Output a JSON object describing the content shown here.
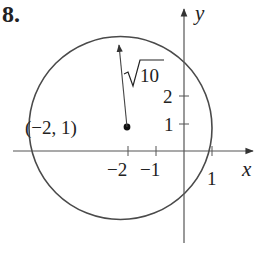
{
  "problem": {
    "number": "8."
  },
  "axes": {
    "x_label": "x",
    "y_label": "y",
    "x_ticks": [
      "−2",
      "−1",
      "1"
    ],
    "y_ticks": [
      "2",
      "1"
    ]
  },
  "circle": {
    "center_label": "(−2, 1)",
    "center": [
      -2,
      1
    ],
    "radius_label": "√10",
    "radius_radicand": "10",
    "equation": "(x+2)^2 + (y-1)^2 = 10"
  },
  "colors": {
    "stroke": "#4a4a4a",
    "text": "#222222"
  }
}
